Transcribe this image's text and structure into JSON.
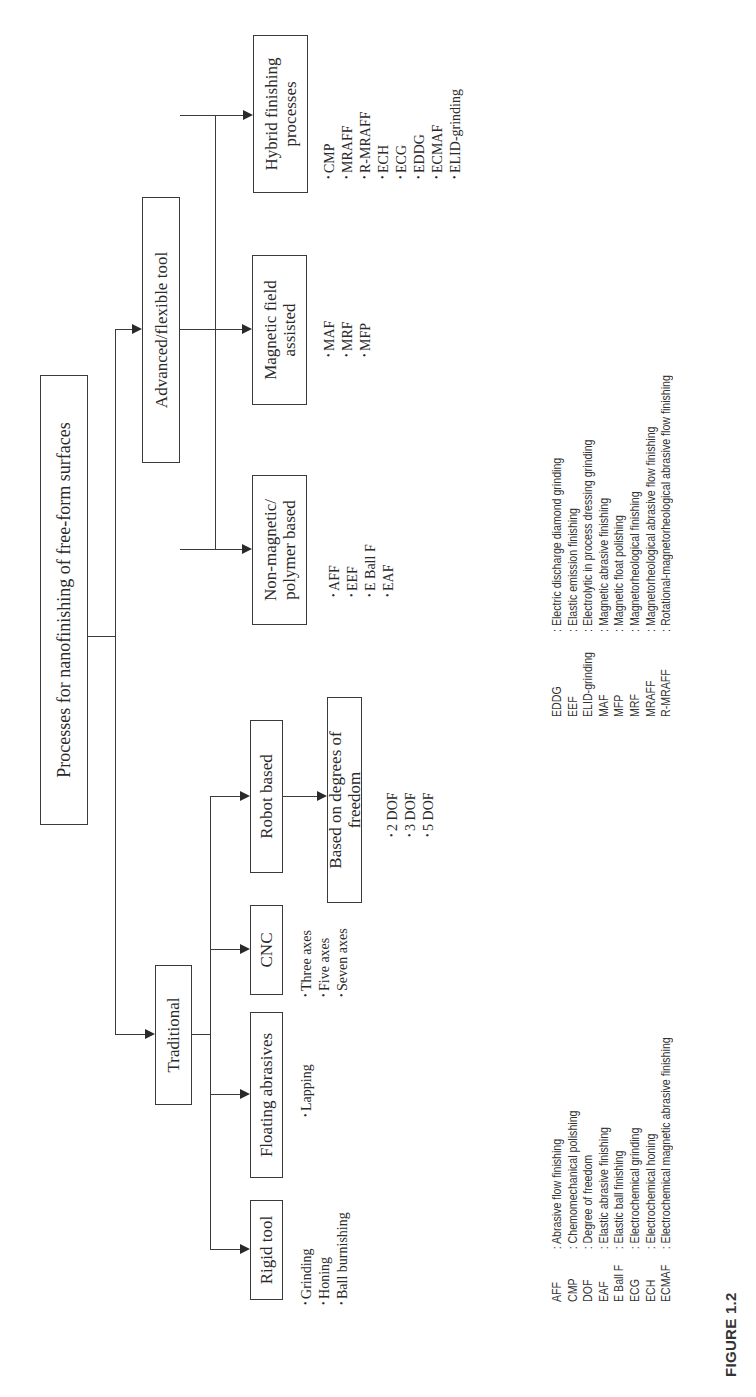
{
  "figure": {
    "caption": "FIGURE 1.2",
    "orientation": "rotated 90° counter-clockwise"
  },
  "root": {
    "label": "Processes for nanofinishing of free-form surfaces"
  },
  "level1": {
    "traditional": {
      "label": "Traditional"
    },
    "advanced": {
      "label": "Advanced/flexible tool"
    }
  },
  "traditional_children": [
    {
      "label": "Rigid tool",
      "items": [
        "Grinding",
        "Honing",
        "Ball burnishing"
      ]
    },
    {
      "label": "Floating abrasives",
      "items": [
        "Lapping"
      ]
    },
    {
      "label": "CNC",
      "items": [
        "Three axes",
        "Five axes",
        "Seven axes"
      ]
    },
    {
      "label": "Robot based",
      "items": []
    }
  ],
  "robot_child": {
    "label": "Based on degrees of freedom",
    "items": [
      "2 DOF",
      "3 DOF",
      "5 DOF"
    ]
  },
  "advanced_children": [
    {
      "label_line1": "Non-magnetic/",
      "label_line2": "polymer based",
      "items": [
        "AFF",
        "EEF",
        "E Ball F",
        "EAF"
      ]
    },
    {
      "label_line1": "Magnetic field",
      "label_line2": "assisted",
      "items": [
        "MAF",
        "MRF",
        "MFP"
      ]
    },
    {
      "label_line1": "Hybrid finishing",
      "label_line2": "processes",
      "items": [
        "CMP",
        "MRAFF",
        "R-MRAFF",
        "ECH",
        "ECG",
        "EDDG",
        "ECMAF",
        "ELID-grinding"
      ]
    }
  ],
  "legend_left": [
    {
      "abbr": "AFF",
      "def": ": Abrasive flow finishing"
    },
    {
      "abbr": "CMP",
      "def": ": Chemomechanical polishing"
    },
    {
      "abbr": "DOF",
      "def": ": Degree of freedom"
    },
    {
      "abbr": "EAF",
      "def": ": Elastic abrasive finishing"
    },
    {
      "abbr": "E Ball F",
      "def": ": Elastic ball finishing"
    },
    {
      "abbr": "ECG",
      "def": ": Electrochemical grinding"
    },
    {
      "abbr": "ECH",
      "def": ": Electrochemical honing"
    },
    {
      "abbr": "ECMAF",
      "def": ": Electrochemical magnetic abrasive finishing"
    }
  ],
  "legend_right": [
    {
      "abbr": "EDDG",
      "def": ": Electric discharge diamond grinding"
    },
    {
      "abbr": "EEF",
      "def": ": Elastic emission finishing"
    },
    {
      "abbr": "ELID-grinding",
      "def": ": Electrolytic in process dressing grinding"
    },
    {
      "abbr": "MAF",
      "def": ": Magnetic abrasive finishing"
    },
    {
      "abbr": "MFP",
      "def": ": Magnetic float polishing"
    },
    {
      "abbr": "MRF",
      "def": ": Magnetorheological finishing"
    },
    {
      "abbr": "MRAFF",
      "def": ": Magnetorheological abrasive flow finishing"
    },
    {
      "abbr": "R-MRAFF",
      "def": ": Rotational-magnetorheological abrasive flow finishing"
    }
  ]
}
